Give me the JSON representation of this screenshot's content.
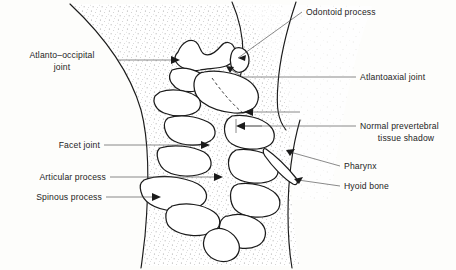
{
  "figure": {
    "background_color": "#fdfdfb",
    "ink_color": "#1b1b1b",
    "leader_color": "#4a4a4a",
    "width": 456,
    "height": 270
  },
  "labels": {
    "odontoid_process": "Odontoid process",
    "atlanto_occipital_joint_line1": "Atlanto–occipital",
    "atlanto_occipital_joint_line2": "joint",
    "atlantoaxial_joint": "Atlantoaxial joint",
    "normal_prevertebral_line1": "Normal prevertebral",
    "normal_prevertebral_line2": "tissue shadow",
    "facet_joint": "Facet joint",
    "pharynx": "Pharynx",
    "articular_process": "Articular process",
    "hyoid_bone": "Hyoid  bone",
    "spinous_process": "Spinous process"
  },
  "structures": {
    "soft_tissue_anterior": "anterior-soft-tissue-outline",
    "soft_tissue_posterior": "posterior-soft-tissue-outline",
    "cervical_vertebrae": "cervical-vertebral-column",
    "stipple": "prevertebral-stipple-shading"
  }
}
